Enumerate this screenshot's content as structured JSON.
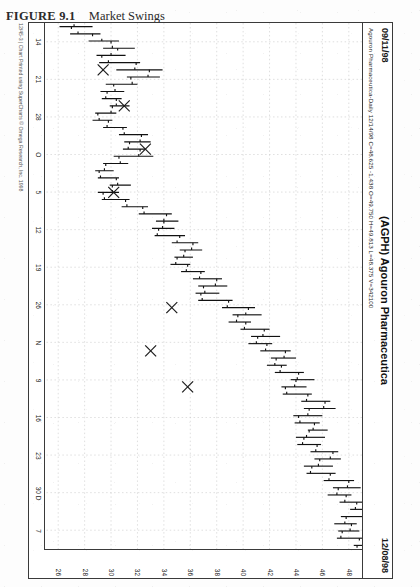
{
  "figure": {
    "number": "FIGURE 9.1",
    "title": "Market Swings"
  },
  "chart_header": {
    "date_left": "09/11/98",
    "symbol_title": "(AGPH) Agouron Pharmaceutica",
    "date_right": "12/08/98",
    "quote_line": "Agouron Pharmaceutica-Daily  12/14/98  C=48.625  -1.438  O=49.750  H=49.813  L=48.375  V=342100"
  },
  "copyright": "12/45-3 | Chart Printed using SuperCharts © Omega Research, Inc. 1998",
  "chart_data": {
    "type": "bar",
    "subtype": "ohlc-bar-chart",
    "title": "(AGPH) Agouron Pharmaceutica",
    "xlabel": "",
    "ylabel": "",
    "grid": true,
    "legend": "none",
    "orientation_note": "chart is rotated 90 degrees on the scanned page",
    "ylim": [
      25,
      49
    ],
    "price_ticks": [
      48,
      46,
      44,
      42,
      40,
      38,
      36,
      34,
      32,
      30,
      28,
      26
    ],
    "date_ticks": [
      "14",
      "21",
      "28",
      "O",
      "5",
      "12",
      "19",
      "26",
      "N",
      "9",
      "16",
      "23",
      "30 D",
      "7"
    ],
    "quote": {
      "symbol": "AGPH",
      "name": "Agouron Pharmaceutica",
      "interval": "Daily",
      "date": "12/14/98",
      "close": 48.625,
      "change": -1.438,
      "open": 49.75,
      "high": 49.813,
      "low": 48.375,
      "volume": 342100
    },
    "annotations": [
      {
        "label": "X",
        "note": "swing high/low marker",
        "x": 6,
        "y": 29.4
      },
      {
        "label": "X",
        "note": "swing high/low marker",
        "x": 11,
        "y": 31.0
      },
      {
        "label": "X",
        "note": "swing high/low marker",
        "x": 17,
        "y": 32.6
      },
      {
        "label": "X",
        "note": "swing high/low marker",
        "x": 23,
        "y": 30.2
      },
      {
        "label": "X",
        "note": "swing high/low marker",
        "x": 39,
        "y": 34.6
      },
      {
        "label": "X",
        "note": "swing high/low marker",
        "x": 45,
        "y": 33.0
      },
      {
        "label": "X",
        "note": "swing high/low marker",
        "x": 50,
        "y": 35.8
      }
    ],
    "bars": [
      {
        "i": 0,
        "open": 27.2,
        "high": 28.6,
        "low": 26.1,
        "close": 27.0
      },
      {
        "i": 1,
        "open": 27.5,
        "high": 29.2,
        "low": 26.9,
        "close": 28.6
      },
      {
        "i": 2,
        "open": 29.3,
        "high": 30.6,
        "low": 28.3,
        "close": 30.0
      },
      {
        "i": 3,
        "open": 30.1,
        "high": 31.8,
        "low": 29.4,
        "close": 30.5
      },
      {
        "i": 4,
        "open": 30.0,
        "high": 31.1,
        "low": 28.9,
        "close": 29.3
      },
      {
        "i": 5,
        "open": 29.8,
        "high": 32.2,
        "low": 29.1,
        "close": 31.9
      },
      {
        "i": 6,
        "open": 31.8,
        "high": 33.9,
        "low": 30.4,
        "close": 32.9
      },
      {
        "i": 7,
        "open": 32.8,
        "high": 33.7,
        "low": 31.2,
        "close": 31.5
      },
      {
        "i": 8,
        "open": 31.6,
        "high": 32.0,
        "low": 29.6,
        "close": 30.2
      },
      {
        "i": 9,
        "open": 30.3,
        "high": 31.0,
        "low": 29.2,
        "close": 29.7
      },
      {
        "i": 10,
        "open": 29.6,
        "high": 30.8,
        "low": 29.3,
        "close": 30.4
      },
      {
        "i": 11,
        "open": 30.4,
        "high": 31.4,
        "low": 29.9,
        "close": 30.1
      },
      {
        "i": 12,
        "open": 30.0,
        "high": 30.4,
        "low": 28.8,
        "close": 29.0
      },
      {
        "i": 13,
        "open": 29.1,
        "high": 30.1,
        "low": 28.6,
        "close": 29.8
      },
      {
        "i": 14,
        "open": 29.7,
        "high": 31.2,
        "low": 29.4,
        "close": 30.9
      },
      {
        "i": 15,
        "open": 31.0,
        "high": 32.8,
        "low": 30.6,
        "close": 32.3
      },
      {
        "i": 16,
        "open": 32.2,
        "high": 33.0,
        "low": 31.0,
        "close": 31.4
      },
      {
        "i": 17,
        "open": 31.3,
        "high": 32.6,
        "low": 30.9,
        "close": 32.2
      },
      {
        "i": 18,
        "open": 32.1,
        "high": 33.2,
        "low": 30.2,
        "close": 30.6
      },
      {
        "i": 19,
        "open": 30.7,
        "high": 31.3,
        "low": 29.4,
        "close": 29.6
      },
      {
        "i": 20,
        "open": 29.5,
        "high": 30.2,
        "low": 28.8,
        "close": 29.1
      },
      {
        "i": 21,
        "open": 29.2,
        "high": 30.6,
        "low": 29.0,
        "close": 30.4
      },
      {
        "i": 22,
        "open": 30.5,
        "high": 31.5,
        "low": 29.9,
        "close": 30.1
      },
      {
        "i": 23,
        "open": 30.1,
        "high": 30.6,
        "low": 29.0,
        "close": 29.4
      },
      {
        "i": 24,
        "open": 29.5,
        "high": 31.4,
        "low": 29.3,
        "close": 31.1
      },
      {
        "i": 25,
        "open": 31.2,
        "high": 32.8,
        "low": 30.8,
        "close": 32.4
      },
      {
        "i": 26,
        "open": 32.5,
        "high": 34.6,
        "low": 32.1,
        "close": 34.2
      },
      {
        "i": 27,
        "open": 34.0,
        "high": 35.1,
        "low": 33.4,
        "close": 34.0
      },
      {
        "i": 28,
        "open": 33.9,
        "high": 34.8,
        "low": 33.1,
        "close": 33.6
      },
      {
        "i": 29,
        "open": 33.5,
        "high": 35.6,
        "low": 33.3,
        "close": 35.2
      },
      {
        "i": 30,
        "open": 35.0,
        "high": 36.6,
        "low": 34.6,
        "close": 36.2
      },
      {
        "i": 31,
        "open": 36.1,
        "high": 36.9,
        "low": 35.2,
        "close": 35.6
      },
      {
        "i": 32,
        "open": 35.5,
        "high": 36.2,
        "low": 34.8,
        "close": 35.0
      },
      {
        "i": 33,
        "open": 34.9,
        "high": 36.0,
        "low": 34.5,
        "close": 35.8
      },
      {
        "i": 34,
        "open": 35.7,
        "high": 37.1,
        "low": 35.3,
        "close": 36.8
      },
      {
        "i": 35,
        "open": 36.7,
        "high": 38.4,
        "low": 36.2,
        "close": 38.0
      },
      {
        "i": 36,
        "open": 37.9,
        "high": 38.8,
        "low": 36.6,
        "close": 37.0
      },
      {
        "i": 37,
        "open": 37.1,
        "high": 38.2,
        "low": 36.4,
        "close": 36.8
      },
      {
        "i": 38,
        "open": 36.9,
        "high": 39.2,
        "low": 36.6,
        "close": 38.9
      },
      {
        "i": 39,
        "open": 38.8,
        "high": 40.9,
        "low": 38.4,
        "close": 40.4
      },
      {
        "i": 40,
        "open": 40.2,
        "high": 41.4,
        "low": 39.2,
        "close": 39.6
      },
      {
        "i": 41,
        "open": 39.5,
        "high": 40.6,
        "low": 38.9,
        "close": 40.2
      },
      {
        "i": 42,
        "open": 40.1,
        "high": 42.0,
        "low": 39.8,
        "close": 41.6
      },
      {
        "i": 43,
        "open": 41.5,
        "high": 42.8,
        "low": 40.6,
        "close": 41.1
      },
      {
        "i": 44,
        "open": 41.0,
        "high": 42.2,
        "low": 40.4,
        "close": 41.8
      },
      {
        "i": 45,
        "open": 41.7,
        "high": 43.6,
        "low": 41.3,
        "close": 43.2
      },
      {
        "i": 46,
        "open": 43.1,
        "high": 44.0,
        "low": 42.1,
        "close": 42.5
      },
      {
        "i": 47,
        "open": 42.4,
        "high": 43.3,
        "low": 41.8,
        "close": 42.9
      },
      {
        "i": 48,
        "open": 42.8,
        "high": 44.6,
        "low": 42.4,
        "close": 44.2
      },
      {
        "i": 49,
        "open": 44.1,
        "high": 45.4,
        "low": 43.6,
        "close": 44.0
      },
      {
        "i": 50,
        "open": 43.9,
        "high": 44.8,
        "low": 42.9,
        "close": 43.2
      },
      {
        "i": 51,
        "open": 43.3,
        "high": 45.2,
        "low": 43.0,
        "close": 44.9
      },
      {
        "i": 52,
        "open": 44.8,
        "high": 46.6,
        "low": 44.4,
        "close": 46.2
      },
      {
        "i": 53,
        "open": 46.1,
        "high": 47.0,
        "low": 44.6,
        "close": 45.0
      },
      {
        "i": 54,
        "open": 44.9,
        "high": 46.0,
        "low": 43.8,
        "close": 44.2
      },
      {
        "i": 55,
        "open": 44.3,
        "high": 45.8,
        "low": 43.9,
        "close": 45.4
      },
      {
        "i": 56,
        "open": 45.3,
        "high": 46.4,
        "low": 44.9,
        "close": 45.0
      },
      {
        "i": 57,
        "open": 44.8,
        "high": 46.2,
        "low": 44.0,
        "close": 44.6
      },
      {
        "i": 58,
        "open": 44.5,
        "high": 45.9,
        "low": 44.1,
        "close": 45.6
      },
      {
        "i": 59,
        "open": 45.5,
        "high": 47.2,
        "low": 45.1,
        "close": 46.8
      },
      {
        "i": 60,
        "open": 46.6,
        "high": 47.4,
        "low": 45.4,
        "close": 45.8
      },
      {
        "i": 61,
        "open": 45.7,
        "high": 46.8,
        "low": 44.6,
        "close": 45.2
      },
      {
        "i": 62,
        "open": 45.1,
        "high": 47.0,
        "low": 44.8,
        "close": 46.6
      },
      {
        "i": 63,
        "open": 46.5,
        "high": 48.4,
        "low": 46.1,
        "close": 48.0
      },
      {
        "i": 64,
        "open": 47.9,
        "high": 48.9,
        "low": 46.8,
        "close": 47.2
      },
      {
        "i": 65,
        "open": 47.1,
        "high": 48.2,
        "low": 46.4,
        "close": 47.8
      },
      {
        "i": 66,
        "open": 47.7,
        "high": 49.0,
        "low": 47.3,
        "close": 48.6
      },
      {
        "i": 67,
        "open": 48.5,
        "high": 49.8,
        "low": 48.1,
        "close": 49.4
      },
      {
        "i": 68,
        "open": 49.3,
        "high": 49.6,
        "low": 47.4,
        "close": 47.8
      },
      {
        "i": 69,
        "open": 47.7,
        "high": 48.6,
        "low": 46.9,
        "close": 48.2
      },
      {
        "i": 70,
        "open": 48.1,
        "high": 48.8,
        "low": 47.2,
        "close": 47.5
      },
      {
        "i": 71,
        "open": 47.4,
        "high": 49.2,
        "low": 47.1,
        "close": 48.8
      },
      {
        "i": 72,
        "open": 49.75,
        "high": 49.813,
        "low": 48.375,
        "close": 48.625
      }
    ]
  }
}
